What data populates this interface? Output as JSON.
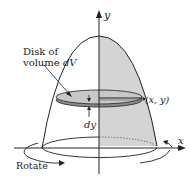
{
  "labels": {
    "y_axis": "y",
    "x_axis": "x",
    "disk_line1": "Disk of",
    "disk_line2_prefix": "volume ",
    "disk_line2_var": "dV",
    "point": "(x, y)",
    "dy": "dy",
    "rotate": "Rotate"
  },
  "colors": {
    "shade": "#d4d4d4",
    "disk_fill": "#c8c8c8",
    "disk_rim": "#8a8a8a",
    "stroke": "#222222"
  }
}
